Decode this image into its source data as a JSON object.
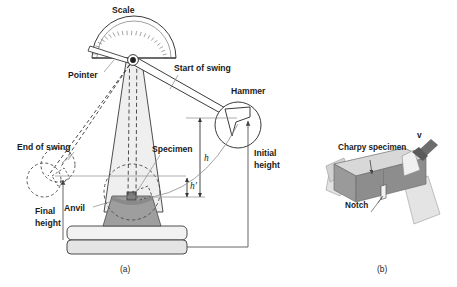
{
  "figure": {
    "panels": [
      {
        "id": "a",
        "label": "(a)",
        "caption": "Impact testing machine"
      },
      {
        "id": "b",
        "label": "(b)",
        "caption": "Charpy specimen on anvil"
      }
    ]
  },
  "panel_a": {
    "labels": {
      "scale": "Scale",
      "pointer": "Pointer",
      "start_of_swing": "Start of swing",
      "hammer": "Hammer",
      "end_of_swing": "End of swing",
      "specimen": "Specimen",
      "anvil": "Anvil",
      "initial_height": "Initial\nheight",
      "initial_height_line1": "Initial",
      "initial_height_line2": "height",
      "final_height_line1": "Final",
      "final_height_line2": "height",
      "h": "h",
      "h_prime": "h'"
    },
    "panel_caption": "(a)"
  },
  "panel_b": {
    "labels": {
      "charpy_specimen": "Charpy specimen",
      "notch": "Notch",
      "velocity": "v"
    },
    "panel_caption": "(b)"
  },
  "colors": {
    "line_dark": "#333333",
    "line_mid": "#555555",
    "line_light": "#888888",
    "tower_fill": "#efefef",
    "base_fill": "#e8e8e8",
    "anvil_fill": "#9e9e9e",
    "specimen_gray": "#8f8f8f",
    "specimen_light": "#cfcfcf",
    "support_light": "#dcdcdc",
    "arrow_dark": "#6b6b6b",
    "text": "#1b1b1b"
  }
}
